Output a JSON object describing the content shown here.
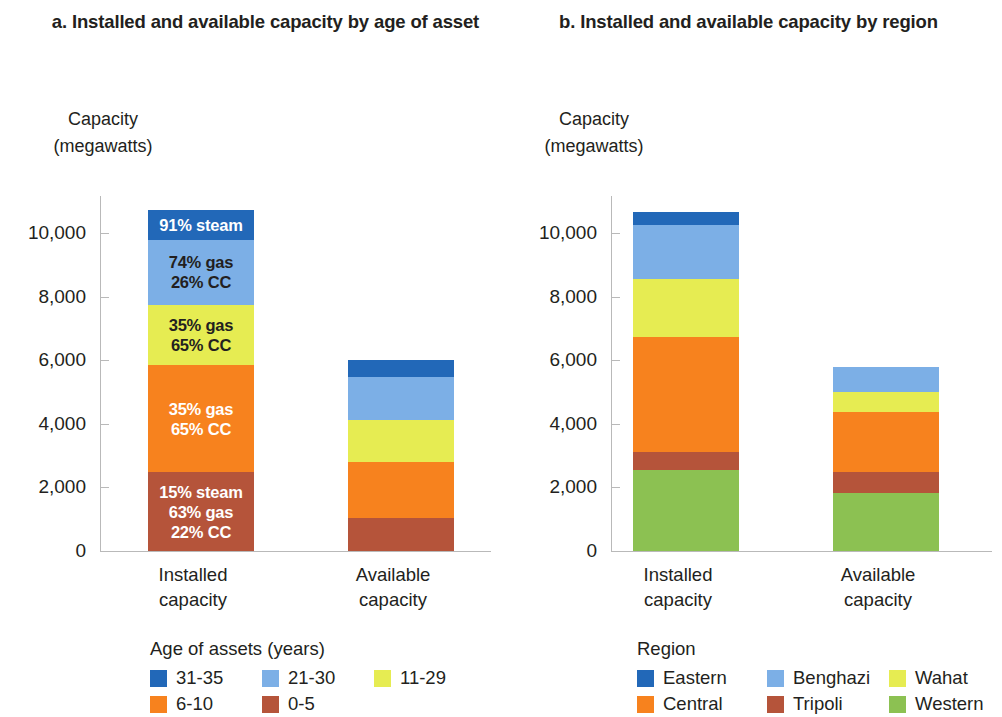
{
  "panel_a": {
    "title": "a. Installed and available capacity\nby age of asset",
    "axis_title": "Capacity\n(megawatts)",
    "legend_title": "Age of assets (years)"
  },
  "panel_b": {
    "title": "b. Installed and available capacity\nby region",
    "axis_title": "Capacity\n(megawatts)",
    "legend_title": "Region"
  },
  "axis": {
    "ticks": [
      "10,000",
      "8,000",
      "6,000",
      "4,000",
      "2,000",
      "0"
    ],
    "tick_values": [
      10000,
      8000,
      6000,
      4000,
      2000,
      0
    ]
  },
  "categories": [
    "Installed\ncapacity",
    "Available\ncapacity"
  ],
  "colors": {
    "dark_blue": "#2268b8",
    "light_blue": "#7cafe6",
    "yellow": "#e6ec52",
    "orange": "#f7821e",
    "brown": "#b5543a",
    "green": "#8cc152"
  },
  "chart_data": [
    {
      "type": "bar",
      "stacked": true,
      "title": "a. Installed and available capacity by age of asset",
      "xlabel": "",
      "ylabel": "Capacity (megawatts)",
      "ylim": [
        0,
        11500
      ],
      "yticks": [
        0,
        2000,
        4000,
        6000,
        8000,
        10000
      ],
      "grid": false,
      "legend_title": "Age of assets (years)",
      "legend_position": "bottom",
      "categories": [
        "Installed capacity",
        "Available capacity"
      ],
      "series": [
        {
          "name": "0-5",
          "color": "#b5543a",
          "values": [
            2480,
            1040
          ],
          "annotations": [
            "15% steam\n63% gas\n22% CC",
            ""
          ]
        },
        {
          "name": "6-10",
          "color": "#f7821e",
          "values": [
            3370,
            1760
          ],
          "annotations": [
            "35% gas\n65% CC",
            ""
          ]
        },
        {
          "name": "11-29",
          "color": "#e6ec52",
          "values": [
            1890,
            1320
          ],
          "annotations": [
            "35% gas\n65% CC",
            ""
          ]
        },
        {
          "name": "21-30",
          "color": "#7cafe6",
          "values": [
            2050,
            1350
          ],
          "annotations": [
            "74% gas\n26% CC",
            ""
          ]
        },
        {
          "name": "31-35",
          "color": "#2268b8",
          "values": [
            940,
            530
          ],
          "annotations": [
            "91% steam",
            ""
          ]
        }
      ],
      "totals": [
        10730,
        6000
      ]
    },
    {
      "type": "bar",
      "stacked": true,
      "title": "b. Installed and available capacity by region",
      "xlabel": "",
      "ylabel": "Capacity (megawatts)",
      "ylim": [
        0,
        11500
      ],
      "yticks": [
        0,
        2000,
        4000,
        6000,
        8000,
        10000
      ],
      "grid": false,
      "legend_title": "Region",
      "legend_position": "bottom",
      "categories": [
        "Installed capacity",
        "Available capacity"
      ],
      "series": [
        {
          "name": "Western",
          "color": "#8cc152",
          "values": [
            2550,
            1820
          ]
        },
        {
          "name": "Tripoli",
          "color": "#b5543a",
          "values": [
            570,
            660
          ]
        },
        {
          "name": "Central",
          "color": "#f7821e",
          "values": [
            3620,
            1890
          ]
        },
        {
          "name": "Wahat",
          "color": "#e6ec52",
          "values": [
            1820,
            630
          ]
        },
        {
          "name": "Benghazi",
          "color": "#7cafe6",
          "values": [
            1700,
            790
          ]
        },
        {
          "name": "Eastern",
          "color": "#2268b8",
          "values": [
            410,
            0
          ]
        }
      ],
      "totals": [
        10670,
        5790
      ]
    }
  ],
  "legend_a": {
    "title": "Age of assets (years)",
    "items": [
      {
        "label": "31-35",
        "color": "#2268b8"
      },
      {
        "label": "21-30",
        "color": "#7cafe6"
      },
      {
        "label": "11-29",
        "color": "#e6ec52"
      },
      {
        "label": "6-10",
        "color": "#f7821e"
      },
      {
        "label": "0-5",
        "color": "#b5543a"
      }
    ]
  },
  "legend_b": {
    "title": "Region",
    "items": [
      {
        "label": "Eastern",
        "color": "#2268b8"
      },
      {
        "label": "Benghazi",
        "color": "#7cafe6"
      },
      {
        "label": "Wahat",
        "color": "#e6ec52"
      },
      {
        "label": "Central",
        "color": "#f7821e"
      },
      {
        "label": "Tripoli",
        "color": "#b5543a"
      },
      {
        "label": "Western",
        "color": "#8cc152"
      }
    ]
  }
}
